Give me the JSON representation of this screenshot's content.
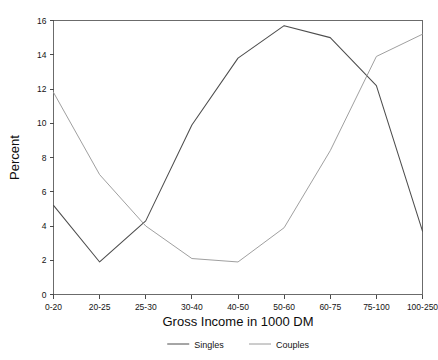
{
  "chart_data": {
    "type": "line",
    "title": "",
    "xlabel": "Gross Income in 1000 DM",
    "ylabel": "Percent",
    "categories": [
      "0-20",
      "20-25",
      "25-30",
      "30-40",
      "40-50",
      "50-60",
      "60-75",
      "75-100",
      "100-250"
    ],
    "ylim": [
      0,
      16
    ],
    "yticks": [
      0,
      2,
      4,
      6,
      8,
      10,
      12,
      14,
      16
    ],
    "ytick_labels": [
      "0",
      "2",
      "4",
      "6",
      "8",
      "10",
      "12",
      "14",
      "16"
    ],
    "grid": false,
    "legend_position": "below-plot-center",
    "series": [
      {
        "name": "Singles",
        "color": "#4d4d4d",
        "values": [
          5.2,
          1.9,
          4.3,
          9.9,
          13.8,
          15.7,
          15.0,
          12.2,
          3.7
        ]
      },
      {
        "name": "Couples",
        "color": "#9a9a9a",
        "values": [
          11.8,
          7.0,
          4.0,
          2.1,
          1.9,
          3.9,
          8.4,
          13.9,
          15.2
        ]
      }
    ]
  },
  "axes": {
    "frame_color": "#6b6b6b"
  },
  "legend": {
    "entries": [
      {
        "label": "Singles"
      },
      {
        "label": "Couples"
      }
    ]
  }
}
